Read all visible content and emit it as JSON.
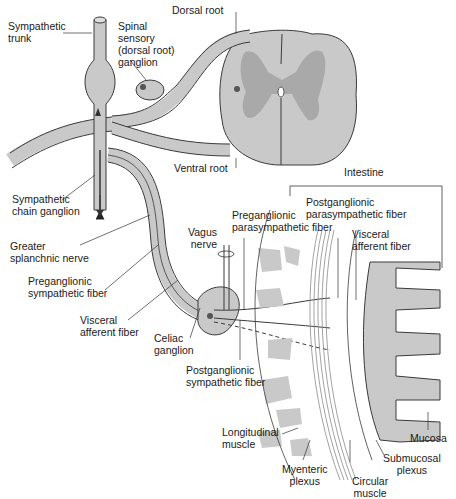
{
  "diagram": {
    "colors": {
      "tissue_fill": "#c9c9c9",
      "gray_matter": "#a9a9a9",
      "outline": "#3a3a3a",
      "background": "#ffffff",
      "fiber": "#333333"
    },
    "labels": {
      "sympathetic_trunk": "Sympathetic\ntrunk",
      "spinal_sensory_ganglion": "Spinal\nsensory\n(dorsal root)\nganglion",
      "dorsal_root": "Dorsal root",
      "ventral_root": "Ventral root",
      "sympathetic_chain_ganglion": "Sympathetic\nchain ganglion",
      "greater_splanchnic_nerve": "Greater\nsplanchnic nerve",
      "preganglionic_sympathetic_fiber": "Preganglionic\nsympathetic fiber",
      "visceral_afferent_fiber_left": "Visceral\nafferent fiber",
      "celiac_ganglion": "Celiac\nganglion",
      "vagus_nerve": "Vagus\nnerve",
      "preganglionic_parasympathetic_fiber": "Preganglionic\nparasympathetic fiber",
      "postganglionic_parasympathetic_fiber": "Postganglionic\nparasympathetic fiber",
      "visceral_afferent_fiber_right": "Visceral\nafferent fiber",
      "intestine": "Intestine",
      "postganglionic_sympathetic_fiber": "Postganglionic\nsympathetic fiber",
      "longitudinal_muscle": "Longitudinal\nmuscle",
      "myenteric_plexus": "Myenteric\nplexus",
      "circular_muscle": "Circular\nmuscle",
      "submucosal_plexus": "Submucosal\nplexus",
      "mucosa": "Mucosa"
    }
  }
}
